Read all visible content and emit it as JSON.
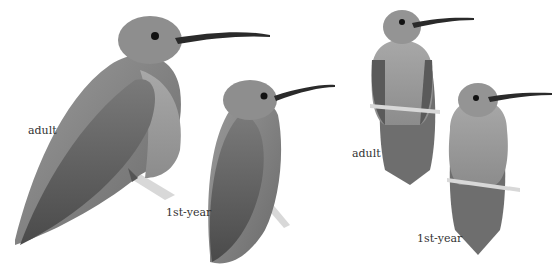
{
  "figure": {
    "panels": [
      {
        "view": "side",
        "birds": [
          {
            "age": "adult",
            "label": "adult"
          },
          {
            "age": "1st-year",
            "label": "1st-year"
          }
        ]
      },
      {
        "view": "front",
        "birds": [
          {
            "age": "adult",
            "label": "adult"
          },
          {
            "age": "1st-year",
            "label": "1st-year"
          }
        ]
      }
    ]
  },
  "colors": {
    "background": "#ffffff",
    "plumage_dark": "#5a5a5a",
    "plumage_mid": "#8a8a8a",
    "plumage_light": "#b5b5b5",
    "bill": "#2a2a2a",
    "perch": "#d8d8d8"
  }
}
